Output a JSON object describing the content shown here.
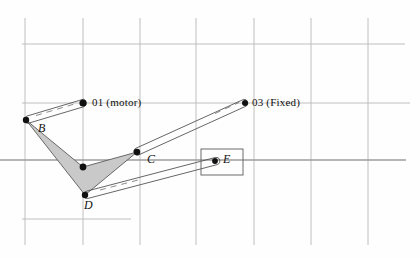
{
  "figure": {
    "type": "mechanism-linkage-diagram",
    "background_color": "#fefefe",
    "grid_color": "#b9b9b9",
    "link_color": "#4a4a4a",
    "body_fill_color": "#c9c9c9",
    "body_stroke_color": "#5a5a5a",
    "joint_color": "#111111"
  },
  "labels": {
    "motor_pivot": "01 (motor)",
    "fixed_pivot": "03 (Fixed)",
    "point_b": "B",
    "point_c": "C",
    "point_d": "D",
    "point_e": "E"
  },
  "nodes": [
    {
      "id": "O1",
      "label": "01 (motor)",
      "x": 83,
      "y": 103,
      "kind": "driven-pivot"
    },
    {
      "id": "O3",
      "label": "03 (Fixed)",
      "x": 245,
      "y": 103,
      "kind": "fixed-pivot"
    },
    {
      "id": "B",
      "label": "B",
      "x": 26,
      "y": 120,
      "kind": "joint"
    },
    {
      "id": "C",
      "label": "C",
      "x": 137,
      "y": 152,
      "kind": "joint"
    },
    {
      "id": "D",
      "label": "D",
      "x": 85,
      "y": 195,
      "kind": "joint"
    },
    {
      "id": "E",
      "label": "E",
      "x": 215,
      "y": 161,
      "kind": "slider-joint"
    },
    {
      "id": "P",
      "label": "",
      "x": 83,
      "y": 167,
      "kind": "joint"
    }
  ],
  "links": [
    {
      "from": "B",
      "to": "O1",
      "style": "double-bar"
    },
    {
      "from": "C",
      "to": "O3",
      "style": "double-bar"
    },
    {
      "from": "D",
      "to": "E",
      "style": "double-bar"
    }
  ],
  "ternary_body": {
    "vertices": [
      "B",
      "P",
      "C",
      "D"
    ],
    "fill": "#c9c9c9",
    "description": "shaded chevron coupler body B-P-C-D"
  },
  "slider_box": {
    "x": 201,
    "y": 149,
    "width": 42,
    "height": 26
  },
  "grid": {
    "vertical_x": [
      25,
      83,
      140,
      196,
      254,
      311,
      368
    ],
    "vertical_y_start": 18,
    "vertical_y_end": 245,
    "horizontals": [
      {
        "y": 44,
        "x_start": 22,
        "x_end": 405
      },
      {
        "y": 103,
        "x_start": 22,
        "x_end": 410
      },
      {
        "y": 160,
        "x_start": 0,
        "x_end": 406
      },
      {
        "y": 219,
        "x_start": 22,
        "x_end": 131
      }
    ]
  }
}
